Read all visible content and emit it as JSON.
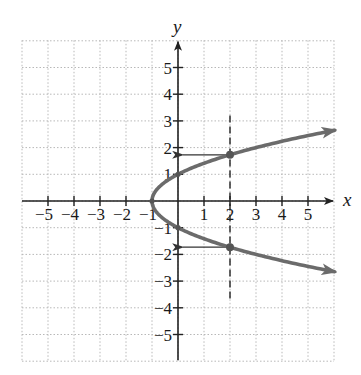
{
  "chart_data": {
    "type": "line",
    "title": "",
    "xlabel": "x",
    "ylabel": "y",
    "xlim": [
      -6,
      6
    ],
    "ylim": [
      -6,
      6
    ],
    "grid": true,
    "grid_style": "dotted",
    "x_ticks": [
      -5,
      -4,
      -3,
      -2,
      -1,
      1,
      2,
      3,
      4,
      5
    ],
    "y_ticks": [
      -5,
      -4,
      -3,
      -2,
      -1,
      1,
      2,
      3,
      4,
      5
    ],
    "x_tick_labels": [
      "−5",
      "−4",
      "−3",
      "−2",
      "−1",
      "1",
      "2",
      "3",
      "4",
      "5"
    ],
    "y_tick_labels": [
      "−5",
      "−4",
      "−3",
      "−2",
      "−1",
      "1",
      "2",
      "3",
      "4",
      "5"
    ],
    "series": [
      {
        "name": "parabola x = y^2 - 1",
        "equation": "x = y^2 - 1",
        "style": "solid",
        "color": "#6b6b6b",
        "arrows_at_ends": true,
        "y_range": [
          -2.65,
          2.65
        ],
        "points": [
          {
            "x": 6.02,
            "y": 2.65
          },
          {
            "x": 3.0,
            "y": 2.0
          },
          {
            "x": 2.0,
            "y": 1.73
          },
          {
            "x": 0.0,
            "y": 1.0
          },
          {
            "x": -1.0,
            "y": 0.0
          },
          {
            "x": 0.0,
            "y": -1.0
          },
          {
            "x": 2.0,
            "y": -1.73
          },
          {
            "x": 3.0,
            "y": -2.0
          },
          {
            "x": 6.02,
            "y": -2.65
          }
        ]
      }
    ],
    "annotations": [
      {
        "type": "vertical-dashed-line",
        "x": 2,
        "y_from": -3.7,
        "y_to": 3.2
      },
      {
        "type": "marked-point",
        "x": 2,
        "y": 1.73
      },
      {
        "type": "marked-point",
        "x": 2,
        "y": -1.73
      },
      {
        "type": "marked-point",
        "x": -1,
        "y": 0
      },
      {
        "type": "marked-point",
        "x": 0,
        "y": 1
      },
      {
        "type": "marked-point",
        "x": 0,
        "y": -1
      },
      {
        "type": "horizontal-arrow",
        "from": {
          "x": 2,
          "y": 1.73
        },
        "to": {
          "x": 0.2,
          "y": 1.73
        }
      },
      {
        "type": "horizontal-arrow",
        "from": {
          "x": 2,
          "y": -1.73
        },
        "to": {
          "x": 0.2,
          "y": -1.73
        }
      }
    ]
  },
  "colors": {
    "axis": "#222222",
    "grid": "#b8b8b8",
    "curve": "#6b6b6b",
    "background": "#ffffff"
  }
}
